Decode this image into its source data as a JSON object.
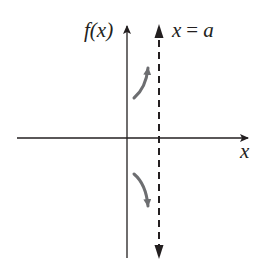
{
  "diagram": {
    "y_axis_label": "f(x)",
    "x_axis_label": "x",
    "asymptote_label": "x = a",
    "asymptote_label_parts": {
      "var": "x",
      "eq": "=",
      "const": "a"
    },
    "colors": {
      "axis": "#231f20",
      "asymptote": "#231f20",
      "curve": "#6d6e71",
      "background": "#ffffff"
    },
    "curves": [
      {
        "name": "upper-branch",
        "direction": "up",
        "approaches": "+infinity"
      },
      {
        "name": "lower-branch",
        "direction": "down",
        "approaches": "-infinity"
      }
    ]
  }
}
